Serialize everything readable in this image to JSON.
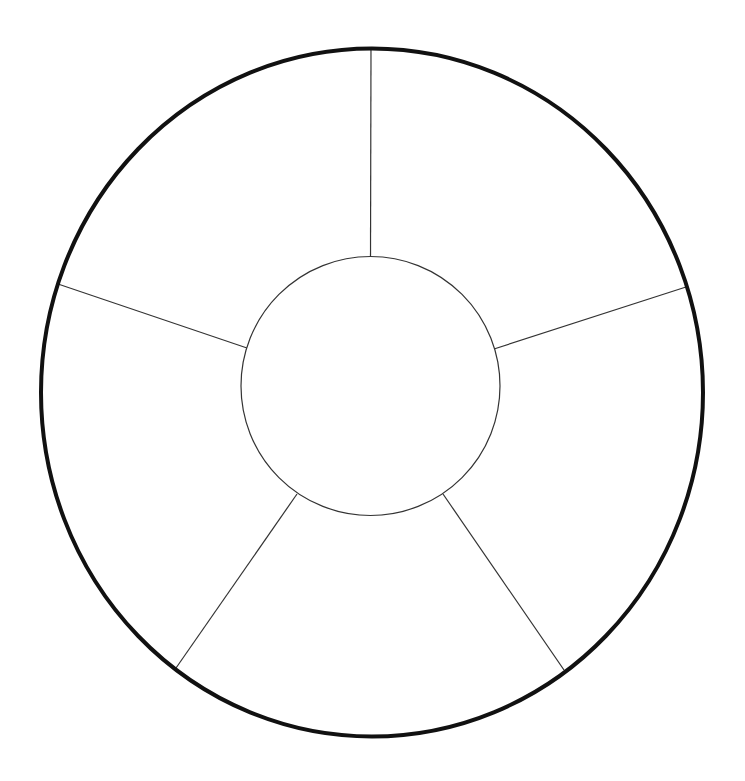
{
  "canvas": {
    "width": 745,
    "height": 781,
    "background": "#ffffff"
  },
  "diagram": {
    "type": "segmented-ring",
    "segments": 5,
    "outer_ring": {
      "cx": 372,
      "cy": 392.5,
      "rx": 331,
      "ry": 344,
      "stroke": "#111111",
      "stroke_width": 4
    },
    "inner_circle": {
      "cx": 370.5,
      "cy": 386,
      "r": 129.5,
      "stroke": "#333333",
      "stroke_width": 1.2
    },
    "spokes": [
      {
        "name": "spoke-top",
        "x1": 370.5,
        "y1": 256.5,
        "x2": 371,
        "y2": 48
      },
      {
        "name": "spoke-upper-right",
        "x1": 494,
        "y1": 349,
        "x2": 686,
        "y2": 287
      },
      {
        "name": "spoke-lower-right",
        "x1": 443,
        "y1": 494,
        "x2": 564,
        "y2": 670
      },
      {
        "name": "spoke-lower-left",
        "x1": 297,
        "y1": 494,
        "x2": 176,
        "y2": 668
      },
      {
        "name": "spoke-upper-left",
        "x1": 247,
        "y1": 348,
        "x2": 58,
        "y2": 284
      }
    ],
    "spoke_stroke": "#333333",
    "spoke_stroke_width": 1.2,
    "labels": []
  }
}
